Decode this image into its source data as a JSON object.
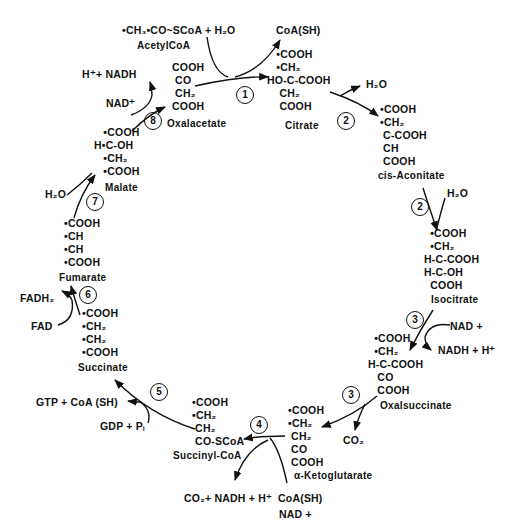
{
  "reactions": {
    "r1": {
      "step": "1",
      "inputs": [
        "•CH3•CO~SCoA",
        "H2O"
      ],
      "input_label": "Acetyl CoA",
      "outputs": [
        "CoA(SH)"
      ]
    },
    "r2a": {
      "step": "2",
      "outputs": [
        "H2O"
      ]
    },
    "r2b": {
      "step": "2",
      "inputs": [
        "H2O"
      ]
    },
    "r3a": {
      "step": "3",
      "inputs": [
        "NAD+"
      ],
      "outputs": [
        "NADH + H+"
      ]
    },
    "r3b": {
      "step": "3",
      "outputs": [
        "CO2"
      ]
    },
    "r4": {
      "step": "4",
      "inputs": [
        "CoA(SH)",
        "NAD+"
      ],
      "outputs": [
        "CO2+ NADH + H+"
      ]
    },
    "r5": {
      "step": "5",
      "inputs": [
        "GDP + Pi"
      ],
      "outputs": [
        "GTP + CoA (SH)"
      ]
    },
    "r6": {
      "step": "6",
      "inputs": [
        "FAD"
      ],
      "outputs": [
        "FADH2"
      ]
    },
    "r7": {
      "step": "7",
      "inputs": [
        "H2O"
      ]
    },
    "r8": {
      "step": "8",
      "inputs": [
        "NAD+"
      ],
      "outputs": [
        "H+ + NADH"
      ]
    }
  },
  "labels": {
    "acetyl_formula": "•CH₃•CO~SCoA  + H₂O",
    "acetyl_name": "AcetylCoA",
    "coa_sh_1": "CoA(SH)",
    "h2o_2a": "H₂O",
    "h2o_2b": "H₂O",
    "nad_3": "NAD +",
    "nadh_3": "NADH + H⁺",
    "co2_3": "CO₂",
    "products_4": "CO₂+ NADH + H⁺",
    "coa_sh_4": "CoA(SH)",
    "nad_4": "NAD +",
    "gtp_5": "GTP +  CoA (SH)",
    "gdp_5": "GDP  + Pᵢ",
    "fadh2_6": "FADH₂",
    "fad_6": "FAD",
    "h2o_7": "H₂O",
    "nadh_8": "H⁺+ NADH",
    "nad_8": "NAD⁺"
  },
  "steps": [
    "1",
    "2",
    "2",
    "3",
    "3",
    "4",
    "5",
    "6",
    "7",
    "8"
  ],
  "compounds": {
    "oxalacetate": {
      "name": "Oxalacetate",
      "structure": "COOH\n CO\n CH₂\nCOOH"
    },
    "citrate": {
      "name": "Citrate",
      "structure": "   •COOH\n   •CH₂\nHO-C-COOH\n    CH₂\n    COOH"
    },
    "cis_aconitate": {
      "name": "cis-Aconitate",
      "structure": "•COOH\n•CH₂\n C-COOH\n CH\n COOH"
    },
    "isocitrate": {
      "name": "Isocitrate",
      "structure": "  •COOH\n  •CH₂\nH-C-COOH\nH-C-OH\n  COOH"
    },
    "oxalsuccinate": {
      "name": "Oxalsuccinate",
      "structure": "  •COOH\n  •CH₂\nH-C-COOH\n   CO\n   COOH"
    },
    "alpha_ketoglutarate": {
      "name": "α-Ketoglutarate",
      "structure": "•COOH\n•CH₂\n CH₂\n CO\n COOH"
    },
    "succinyl_coa": {
      "name": "Succinyl-CoA",
      "structure": "•COOH\n•CH₂\n CH₂\n CO-SCoA"
    },
    "succinate": {
      "name": "Succinate",
      "structure": "•COOH\n•CH₂\n•CH₂\n•COOH"
    },
    "fumarate": {
      "name": "Fumarate",
      "structure": "•COOH\n•CH\n•CH\n•COOH"
    },
    "malate": {
      "name": "Malate",
      "structure": "   •COOH\nH•C-OH\n   •CH₂\n   •COOH"
    }
  }
}
